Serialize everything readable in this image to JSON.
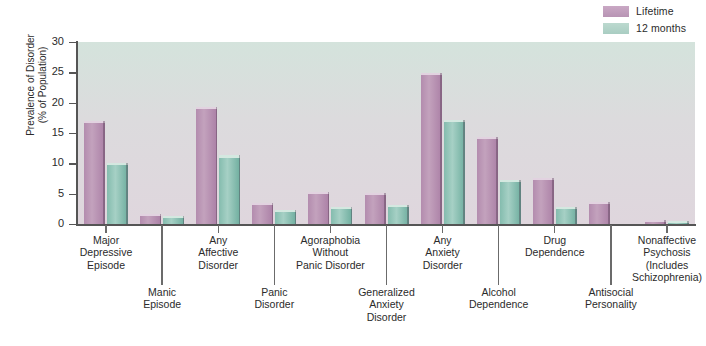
{
  "legend": {
    "items": [
      {
        "label": "Lifetime",
        "color": "#b894b4",
        "icon": "legend-swatch"
      },
      {
        "label": "12 months",
        "color": "#a9cdc2",
        "icon": "legend-swatch"
      }
    ]
  },
  "axis": {
    "y_title_line1": "Prevalence of Disorder",
    "y_title_line2": "(% of Population)",
    "y_ticks": [
      "0",
      "5",
      "10",
      "15",
      "20",
      "25",
      "30"
    ]
  },
  "chart_data": {
    "type": "bar",
    "title": "",
    "xlabel": "",
    "ylabel": "Prevalence of Disorder (% of Population)",
    "ylim": [
      0,
      30
    ],
    "ytick_step": 5,
    "grid": false,
    "legend_position": "top-right",
    "categories": [
      "Major Depressive Episode",
      "Manic Episode",
      "Any Affective Disorder",
      "Panic Disorder",
      "Agoraphobia Without Panic Disorder",
      "Generalized Anxiety Disorder",
      "Any Anxiety Disorder",
      "Alcohol Dependence",
      "Drug Dependence",
      "Antisocial Personality",
      "Nonaffective Psychosis (Includes Schizophrenia)"
    ],
    "series": [
      {
        "name": "Lifetime",
        "values": [
          17.0,
          1.6,
          19.3,
          3.5,
          5.3,
          5.1,
          24.9,
          14.3,
          7.6,
          3.7,
          0.7
        ]
      },
      {
        "name": "12 months",
        "values": [
          10.1,
          1.3,
          11.3,
          2.3,
          2.8,
          3.1,
          17.2,
          7.3,
          2.8,
          0.0,
          0.5
        ]
      }
    ]
  },
  "x_label_rows": [
    {
      "row": "top",
      "lines": [
        "Major",
        "Depressive",
        "Episode"
      ]
    },
    {
      "row": "bottom",
      "lines": [
        "Manic",
        "Episode"
      ]
    },
    {
      "row": "top",
      "lines": [
        "Any",
        "Affective",
        "Disorder"
      ]
    },
    {
      "row": "bottom",
      "lines": [
        "Panic",
        "Disorder"
      ]
    },
    {
      "row": "top",
      "lines": [
        "Agoraphobia",
        "Without",
        "Panic Disorder"
      ]
    },
    {
      "row": "bottom",
      "lines": [
        "Generalized",
        "Anxiety",
        "Disorder"
      ]
    },
    {
      "row": "top",
      "lines": [
        "Any",
        "Anxiety",
        "Disorder"
      ]
    },
    {
      "row": "bottom",
      "lines": [
        "Alcohol",
        "Dependence"
      ]
    },
    {
      "row": "top",
      "lines": [
        "Drug",
        "Dependence"
      ]
    },
    {
      "row": "bottom",
      "lines": [
        "Antisocial",
        "Personality"
      ]
    },
    {
      "row": "top",
      "lines": [
        "Nonaffective",
        "Psychosis",
        "(Includes",
        "Schizophrenia)"
      ]
    }
  ]
}
